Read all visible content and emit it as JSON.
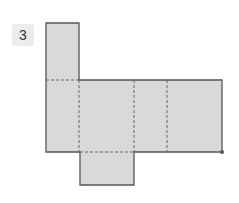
{
  "problem": {
    "number": "3"
  },
  "diagram": {
    "type": "net",
    "fill": "#d9d9d9",
    "stroke": "#555555",
    "dash": "#666666",
    "faces": 6
  }
}
